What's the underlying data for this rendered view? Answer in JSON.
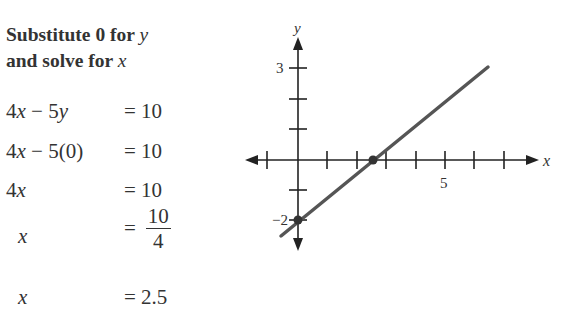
{
  "heading": {
    "line1_prefix": "Substitute 0 for ",
    "line1_var": "y",
    "line2_prefix": "and solve for ",
    "line2_var": "x"
  },
  "steps": [
    {
      "lhs": "4x − 5y",
      "rhs": "= 10"
    },
    {
      "lhs": "4x − 5(0)",
      "rhs": "= 10"
    },
    {
      "lhs": "4x",
      "rhs": "= 10"
    },
    {
      "lhs": "x",
      "rhs_eq": "=",
      "numerator": "10",
      "denominator": "4"
    },
    {
      "lhs": "x",
      "rhs": "= 2.5"
    }
  ],
  "chart_data": {
    "type": "line",
    "title": "",
    "equation": "4x − 5y = 10",
    "xlabel": "x",
    "ylabel": "y",
    "x_tick_labels": [
      {
        "value": 5,
        "label": "5"
      }
    ],
    "y_tick_labels": [
      {
        "value": 3,
        "label": "3"
      },
      {
        "value": -2,
        "label": "−2"
      }
    ],
    "xlim": [
      -1.5,
      8.3
    ],
    "ylim": [
      -2.9,
      3.9
    ],
    "x_ticks": [
      -1,
      1,
      2,
      3,
      4,
      5,
      6,
      7
    ],
    "y_ticks": [
      -2,
      -1,
      1,
      2,
      3
    ],
    "grid": false,
    "series": [
      {
        "name": "4x − 5y = 10",
        "x": [
          -0.55,
          6.4
        ],
        "y": [
          -2.44,
          3.12
        ],
        "color": "#555555"
      }
    ],
    "points": [
      {
        "x": 0,
        "y": -2,
        "label": "y-intercept"
      },
      {
        "x": 2.5,
        "y": 0,
        "label": "x-intercept"
      }
    ]
  }
}
